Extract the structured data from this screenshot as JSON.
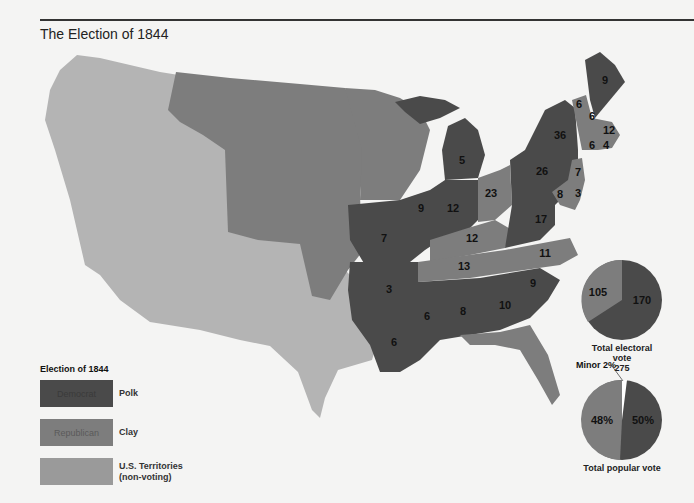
{
  "title": "The Election of 1844",
  "colors": {
    "democrat": "#4a4a4a",
    "republican": "#7d7d7d",
    "territory": "#b4b4b4",
    "background": "#f4f4f3"
  },
  "legend": {
    "title": "Election of 1844",
    "items": [
      {
        "swatch_text": "Democrat",
        "label": "Polk",
        "color": "#4a4a4a"
      },
      {
        "swatch_text": "Republican",
        "label": "Clay",
        "color": "#7d7d7d"
      },
      {
        "swatch_text": "",
        "label_line1": "U.S. Territories",
        "label_line2": "(non-voting)",
        "color": "#b4b4b4"
      }
    ]
  },
  "state_labels": [
    {
      "value": "9",
      "party": "democrat",
      "x": 605,
      "y": 80
    },
    {
      "value": "6",
      "party": "republican",
      "x": 579,
      "y": 104
    },
    {
      "value": "6",
      "party": "democrat",
      "x": 592,
      "y": 116
    },
    {
      "value": "12",
      "party": "republican",
      "x": 609,
      "y": 130
    },
    {
      "value": "6",
      "party": "republican",
      "x": 592,
      "y": 145
    },
    {
      "value": "4",
      "party": "republican",
      "x": 606,
      "y": 145
    },
    {
      "value": "36",
      "party": "democrat",
      "x": 560,
      "y": 135
    },
    {
      "value": "26",
      "party": "democrat",
      "x": 542,
      "y": 171
    },
    {
      "value": "7",
      "party": "republican",
      "x": 578,
      "y": 172
    },
    {
      "value": "8",
      "party": "republican",
      "x": 560,
      "y": 194
    },
    {
      "value": "3",
      "party": "republican",
      "x": 578,
      "y": 193
    },
    {
      "value": "5",
      "party": "democrat",
      "x": 462,
      "y": 160
    },
    {
      "value": "23",
      "party": "republican",
      "x": 491,
      "y": 193
    },
    {
      "value": "9",
      "party": "democrat",
      "x": 421,
      "y": 208
    },
    {
      "value": "12",
      "party": "democrat",
      "x": 453,
      "y": 208
    },
    {
      "value": "17",
      "party": "democrat",
      "x": 541,
      "y": 219
    },
    {
      "value": "12",
      "party": "republican",
      "x": 472,
      "y": 238
    },
    {
      "value": "7",
      "party": "democrat",
      "x": 384,
      "y": 238
    },
    {
      "value": "13",
      "party": "republican",
      "x": 464,
      "y": 266
    },
    {
      "value": "11",
      "party": "republican",
      "x": 545,
      "y": 253
    },
    {
      "value": "3",
      "party": "democrat",
      "x": 389,
      "y": 289
    },
    {
      "value": "9",
      "party": "democrat",
      "x": 533,
      "y": 283
    },
    {
      "value": "6",
      "party": "democrat",
      "x": 427,
      "y": 316
    },
    {
      "value": "8",
      "party": "democrat",
      "x": 463,
      "y": 311
    },
    {
      "value": "10",
      "party": "democrat",
      "x": 505,
      "y": 305
    },
    {
      "value": "6",
      "party": "democrat",
      "x": 394,
      "y": 342
    }
  ],
  "chart_data": [
    {
      "type": "pie",
      "title": "Total electoral vote",
      "total": "275",
      "labels": [
        "Polk (Democrat)",
        "Clay (Republican)"
      ],
      "values": [
        170,
        105
      ],
      "slice_labels": [
        "170",
        "105"
      ]
    },
    {
      "type": "pie",
      "title": "Total popular vote",
      "labels": [
        "Polk (Democrat)",
        "Clay (Republican)",
        "Minor"
      ],
      "values": [
        50,
        48,
        2
      ],
      "slice_labels": [
        "50%",
        "48%",
        "Minor 2%"
      ]
    }
  ],
  "pies": {
    "electoral": {
      "caption": "Total electoral vote",
      "total": "275",
      "dem_label": "170",
      "rep_label": "105"
    },
    "popular": {
      "caption": "Total popular vote",
      "dem_label": "50%",
      "rep_label": "48%",
      "minor_label": "Minor 2%"
    }
  }
}
